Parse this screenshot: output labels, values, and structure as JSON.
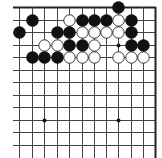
{
  "diagram": {
    "type": "go-board-corner",
    "visible_edges": [
      "top",
      "right"
    ],
    "grid": {
      "cols_x": [
        19,
        32,
        44,
        57,
        69,
        82,
        94,
        106,
        118,
        131,
        143,
        155
      ],
      "rows_y": [
        7,
        20,
        32,
        45,
        57,
        70,
        82,
        95,
        107,
        120,
        132,
        145
      ],
      "line_start_x": 13,
      "line_end_y": 158,
      "line_color": "#444444",
      "edge_color": "#222222"
    },
    "hoshi": [
      {
        "col": 8,
        "row": 3
      },
      {
        "col": 2,
        "row": 9
      },
      {
        "col": 8,
        "row": 9
      }
    ],
    "stones": [
      {
        "color": "black",
        "col": 8,
        "row": 0
      },
      {
        "color": "black",
        "col": 1,
        "row": 1
      },
      {
        "color": "white",
        "col": 4,
        "row": 1
      },
      {
        "color": "black",
        "col": 5,
        "row": 1
      },
      {
        "color": "black",
        "col": 6,
        "row": 1
      },
      {
        "color": "black",
        "col": 7,
        "row": 1
      },
      {
        "color": "white",
        "col": 8,
        "row": 1
      },
      {
        "color": "black",
        "col": 9,
        "row": 1
      },
      {
        "color": "black",
        "col": 0,
        "row": 2
      },
      {
        "color": "black",
        "col": 3,
        "row": 2
      },
      {
        "color": "black",
        "col": 4,
        "row": 2
      },
      {
        "color": "white",
        "col": 5,
        "row": 2
      },
      {
        "color": "white",
        "col": 6,
        "row": 2
      },
      {
        "color": "white",
        "col": 7,
        "row": 2
      },
      {
        "color": "white",
        "col": 8,
        "row": 2
      },
      {
        "color": "black",
        "col": 9,
        "row": 2
      },
      {
        "color": "white",
        "col": 2,
        "row": 3
      },
      {
        "color": "white",
        "col": 3,
        "row": 3
      },
      {
        "color": "black",
        "col": 4,
        "row": 3
      },
      {
        "color": "black",
        "col": 5,
        "row": 3
      },
      {
        "color": "white",
        "col": 6,
        "row": 3
      },
      {
        "color": "black",
        "col": 9,
        "row": 3
      },
      {
        "color": "black",
        "col": 10,
        "row": 3
      },
      {
        "color": "black",
        "col": 1,
        "row": 4
      },
      {
        "color": "black",
        "col": 2,
        "row": 4
      },
      {
        "color": "black",
        "col": 3,
        "row": 4
      },
      {
        "color": "white",
        "col": 4,
        "row": 4
      },
      {
        "color": "white",
        "col": 5,
        "row": 4
      },
      {
        "color": "white",
        "col": 6,
        "row": 4
      },
      {
        "color": "white",
        "col": 8,
        "row": 4
      },
      {
        "color": "white",
        "col": 9,
        "row": 4
      },
      {
        "color": "white",
        "col": 10,
        "row": 4
      }
    ],
    "stone_radius": 6,
    "colors": {
      "black_stone": "#111111",
      "white_stone_fill": "#ffffff",
      "white_stone_stroke": "#222222"
    }
  }
}
